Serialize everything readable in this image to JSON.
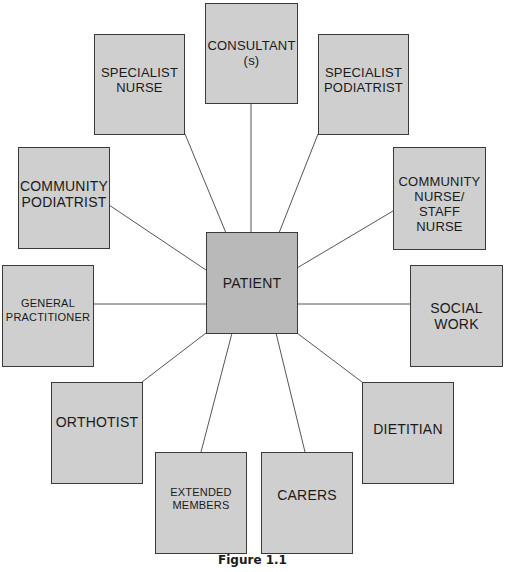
{
  "figure": {
    "caption": "Figure 1.1",
    "colors": {
      "center_fill": "#b9b9b9",
      "node_fill": "#cfcfcf",
      "border": "#3a3a3a",
      "edge": "#555555"
    },
    "center": {
      "id": "patient",
      "lines": [
        "PATIENT"
      ]
    },
    "nodes": [
      {
        "id": "consultant",
        "lines": [
          "CONSULTANT",
          "(s)"
        ]
      },
      {
        "id": "specialist-nurse",
        "lines": [
          "SPECIALIST",
          "NURSE"
        ]
      },
      {
        "id": "specialist-podiatrist",
        "lines": [
          "SPECIALIST",
          "PODIATRIST"
        ]
      },
      {
        "id": "community-podiatrist",
        "lines": [
          "COMMUNITY",
          "PODIATRIST"
        ]
      },
      {
        "id": "community-nurse",
        "lines": [
          "COMMUNITY",
          "NURSE/",
          "STAFF",
          "NURSE"
        ]
      },
      {
        "id": "general-practitioner",
        "lines": [
          "GENERAL",
          "PRACTITIONER"
        ]
      },
      {
        "id": "social-work",
        "lines": [
          "SOCIAL",
          "WORK"
        ]
      },
      {
        "id": "orthotist",
        "lines": [
          "ORTHOTIST"
        ]
      },
      {
        "id": "dietitian",
        "lines": [
          "DIETITIAN"
        ]
      },
      {
        "id": "extended-members",
        "lines": [
          "EXTENDED",
          "MEMBERS"
        ]
      },
      {
        "id": "carers",
        "lines": [
          "CARERS"
        ]
      }
    ],
    "edges": [
      [
        "patient",
        "consultant"
      ],
      [
        "patient",
        "specialist-nurse"
      ],
      [
        "patient",
        "specialist-podiatrist"
      ],
      [
        "patient",
        "community-podiatrist"
      ],
      [
        "patient",
        "community-nurse"
      ],
      [
        "patient",
        "general-practitioner"
      ],
      [
        "patient",
        "social-work"
      ],
      [
        "patient",
        "orthotist"
      ],
      [
        "patient",
        "dietitian"
      ],
      [
        "patient",
        "extended-members"
      ],
      [
        "patient",
        "carers"
      ]
    ]
  }
}
